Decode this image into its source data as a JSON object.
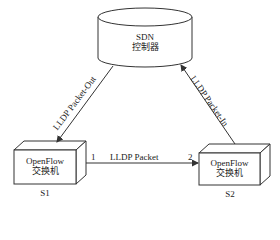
{
  "controller": {
    "line1": "SDN",
    "line2": "控制器"
  },
  "switches": [
    {
      "id": "S1",
      "line1": "OpenFlow",
      "line2": "交换机",
      "port": "1"
    },
    {
      "id": "S2",
      "line1": "OpenFlow",
      "line2": "交换机",
      "port": "2"
    }
  ],
  "links": {
    "packet_out": "LLDP Packet-Out",
    "packet_in": "LLDP Packet-In",
    "lldp": "LLDP Packet"
  },
  "colors": {
    "stroke": "#333333",
    "fill": "#ffffff",
    "text": "#222222"
  }
}
